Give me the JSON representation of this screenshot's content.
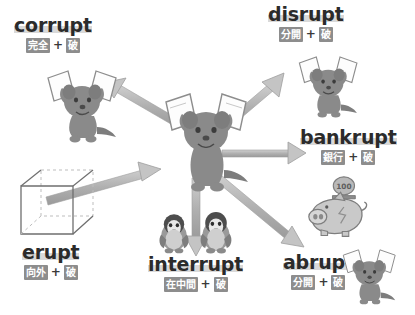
{
  "diagram": {
    "root_meaning": "破",
    "background_color": "#ffffff",
    "badge_color": "#8d8d8d",
    "badge_text_color": "#ffffff",
    "word_color": "#2b2b2b",
    "word_highlight_color": "#d9d9d9",
    "arrow_color": "#b3b3b3",
    "figure_color": "#8a8a8a",
    "plus_symbol": "+"
  },
  "center": {
    "icon": "dog-tearing-paper",
    "label": "center-figure"
  },
  "nodes": [
    {
      "id": "corrupt",
      "word": "corrupt",
      "parts": [
        "完全",
        "破"
      ],
      "icon": "dog-tearing-paper",
      "arrow_direction": "up-left"
    },
    {
      "id": "disrupt",
      "word": "disrupt",
      "parts": [
        "分開",
        "破"
      ],
      "icon": "dog-tearing-paper",
      "arrow_direction": "up-right"
    },
    {
      "id": "bankrupt",
      "word": "bankrupt",
      "parts": [
        "銀行",
        "破"
      ],
      "icon": "piggy-bank-coin",
      "arrow_direction": "right"
    },
    {
      "id": "abrupt",
      "word": "abrupt",
      "parts": [
        "分開",
        "破"
      ],
      "icon": "dog-tearing-paper",
      "arrow_direction": "down-right"
    },
    {
      "id": "interrupt",
      "word": "interrupt",
      "parts": [
        "在中間",
        "破"
      ],
      "icon": "two-penguins",
      "arrow_direction": "down"
    },
    {
      "id": "erupt",
      "word": "erupt",
      "parts": [
        "向外",
        "破"
      ],
      "icon": "wireframe-cube-pierced",
      "arrow_direction": "up-right-outward"
    }
  ],
  "piggy_bank": {
    "coin_label": "100"
  }
}
